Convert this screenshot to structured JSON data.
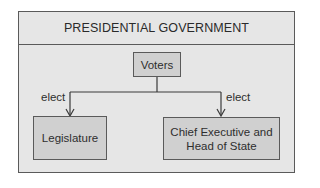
{
  "diagram": {
    "title": "PRESIDENTIAL GOVERNMENT",
    "nodes": {
      "voters": "Voters",
      "legislature": "Legislature",
      "chief_executive_line1": "Chief Executive and",
      "chief_executive_line2": "Head of State"
    },
    "edges": [
      {
        "from": "Voters",
        "to": "Legislature",
        "label": "elect"
      },
      {
        "from": "Voters",
        "to": "Chief Executive and Head of State",
        "label": "elect"
      }
    ],
    "edge_labels": {
      "left": "elect",
      "right": "elect"
    },
    "colors": {
      "panel_bg": "#e6e6e6",
      "node_bg": "#d0d0d0",
      "border": "#5a5a5a"
    }
  }
}
